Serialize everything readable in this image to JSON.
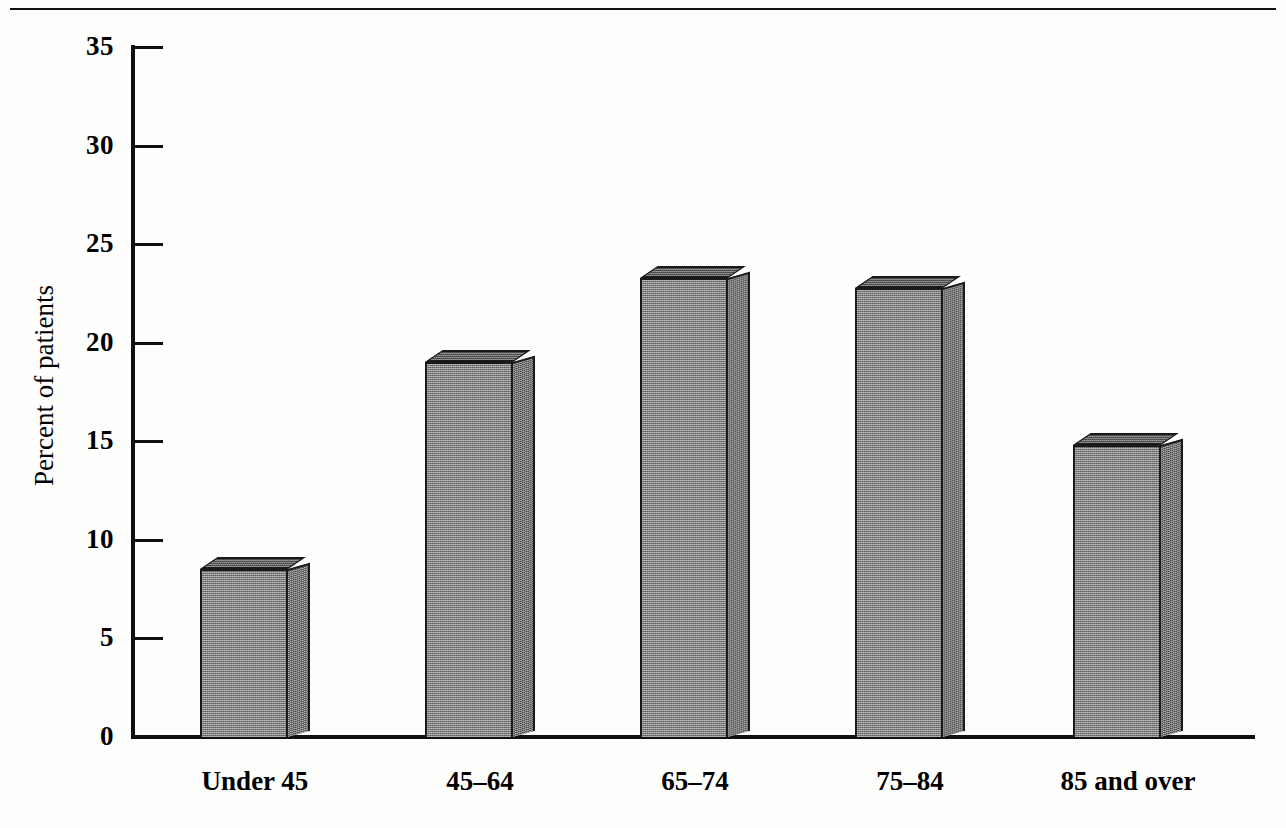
{
  "page": {
    "top_rule": true
  },
  "chart_data": {
    "type": "bar",
    "title": "",
    "subtitle": "",
    "xlabel": "",
    "ylabel": "Percent of patients",
    "categories": [
      "Under 45",
      "45–64",
      "65–74",
      "75–84",
      "85 and over"
    ],
    "values": [
      8.5,
      19.0,
      23.3,
      22.8,
      14.8
    ],
    "ylim": [
      0,
      35
    ],
    "yticks": [
      0,
      5,
      10,
      15,
      20,
      25,
      30,
      35
    ],
    "ytick_labels": [
      "0",
      "5",
      "10",
      "15",
      "20",
      "25",
      "30",
      "35"
    ],
    "grid": false,
    "legend": false,
    "legend_position": "none",
    "style": "3d-block-bars",
    "bar_fill_color": "#8d8d8d",
    "bar_side_color": "#7c7c7c",
    "bar_top_color": "#6f6f6f",
    "axis_color": "#101010",
    "background_color": "#fefefd",
    "annotations": []
  },
  "axis": {
    "y_title": "Percent of patients"
  }
}
